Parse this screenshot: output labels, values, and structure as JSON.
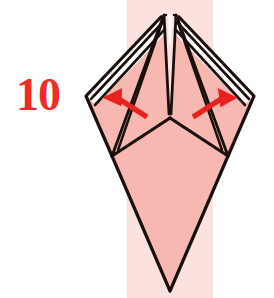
{
  "figure": {
    "kind": "origami-fold-diagram",
    "step_number": "10",
    "step_number_color": "#ee2b25",
    "background_color": "#ffffff",
    "paper_fill_color": "#f6b8b1",
    "paper_fill_color_light": "#fbe0dd",
    "paper_back_color": "#ffffff",
    "ink_color": "#1a0f0c",
    "band": {
      "name": "vertical-background-band",
      "color": "#fbe2de",
      "x": 127,
      "width": 86,
      "y": 0,
      "height": 298
    },
    "arrows": [
      {
        "name": "fold-arrow-left",
        "direction": "up-left",
        "color": "#e8221f",
        "from_x": 146,
        "from_y": 116,
        "to_x": 112,
        "to_y": 94
      },
      {
        "name": "fold-arrow-right",
        "direction": "up-right",
        "color": "#e8221f",
        "from_x": 194,
        "from_y": 116,
        "to_x": 228,
        "to_y": 94
      }
    ],
    "geometry": {
      "apex_left_x": 163,
      "apex_right_x": 176,
      "apex_y": 14,
      "center_x": 170,
      "center_junction_y": 118,
      "wing_tip_left_x": 86,
      "wing_tip_left_y": 96,
      "wing_tip_right_x": 254,
      "wing_tip_right_y": 96,
      "side_corner_left_x": 112,
      "side_corner_left_y": 156,
      "side_corner_right_x": 228,
      "side_corner_right_y": 156,
      "bottom_point_x": 170,
      "bottom_point_y": 291
    },
    "labels": {
      "alt_text": "Origami step 10: squash-folded kite shape with two arrows indicating outward folds"
    }
  }
}
